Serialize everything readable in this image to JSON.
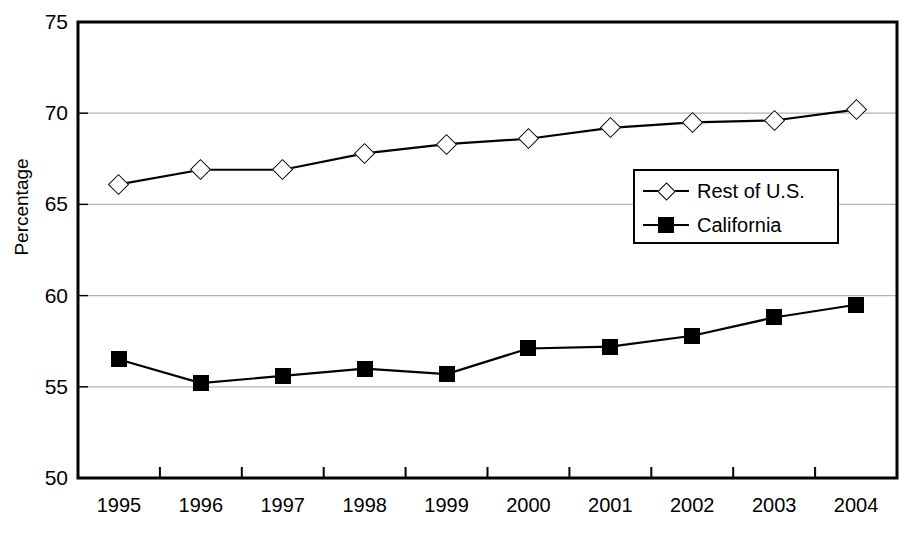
{
  "chart_data": {
    "type": "line",
    "title": "",
    "xlabel": "",
    "ylabel": "Percentage",
    "categories": [
      "1995",
      "1996",
      "1997",
      "1998",
      "1999",
      "2000",
      "2001",
      "2002",
      "2003",
      "2004"
    ],
    "ylim": [
      50,
      75
    ],
    "yticks": [
      50,
      55,
      60,
      65,
      70,
      75
    ],
    "grid": "horizontal",
    "legend_position": "center-right-inside",
    "series": [
      {
        "name": "Rest of U.S.",
        "marker": "open-diamond",
        "color": "#000000",
        "values": [
          66.1,
          66.9,
          66.9,
          67.8,
          68.3,
          68.6,
          69.2,
          69.5,
          69.6,
          70.2
        ]
      },
      {
        "name": "California",
        "marker": "filled-square",
        "color": "#000000",
        "values": [
          56.5,
          55.2,
          55.6,
          56.0,
          55.7,
          57.1,
          57.2,
          57.8,
          58.8,
          59.5
        ]
      }
    ]
  },
  "axis": {
    "y_title": "Percentage",
    "y_tick_labels": [
      "75",
      "70",
      "65",
      "60",
      "55",
      "50"
    ],
    "x_tick_labels": [
      "1995",
      "1996",
      "1997",
      "1998",
      "1999",
      "2000",
      "2001",
      "2002",
      "2003",
      "2004"
    ]
  },
  "legend": {
    "entries": [
      {
        "label": "Rest of U.S."
      },
      {
        "label": "California"
      }
    ]
  },
  "colors": {
    "line": "#000000",
    "grid": "#b4b4b4",
    "frame": "#000000",
    "background": "#ffffff"
  }
}
